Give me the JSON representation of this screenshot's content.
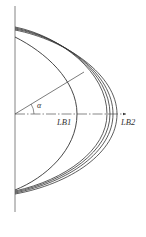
{
  "diagram": {
    "type": "geometric-profile-curves",
    "labels": {
      "angle": "α",
      "inner_curve": "LB1",
      "outer_curve": "LB2"
    },
    "axes": {
      "vertical": {
        "x": 15,
        "y_start": 6,
        "y_end": 212
      },
      "horizontal": {
        "y": 114,
        "x_start": 15,
        "x_end": 126,
        "style": "dash-dot",
        "arrow": true
      }
    },
    "curves": [
      {
        "name": "LB1",
        "top_y": 37,
        "apex_x": 77,
        "bottom_y": 190
      },
      {
        "name": "outer-1",
        "top_y": 27,
        "apex_x": 107,
        "bottom_y": 191
      },
      {
        "name": "outer-2",
        "top_y": 28,
        "apex_x": 110,
        "bottom_y": 192
      },
      {
        "name": "outer-3",
        "top_y": 29,
        "apex_x": 113,
        "bottom_y": 193
      },
      {
        "name": "LB2",
        "top_y": 30,
        "apex_x": 117,
        "bottom_y": 194
      }
    ],
    "ray": {
      "from": [
        15,
        114
      ],
      "to": [
        84,
        72
      ]
    },
    "colors": {
      "stroke": "#333333",
      "axis": "#555555",
      "background": "#ffffff"
    }
  }
}
